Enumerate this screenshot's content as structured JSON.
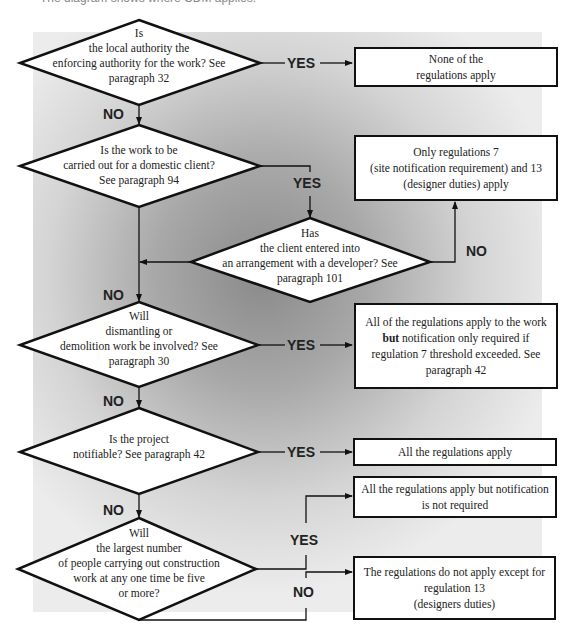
{
  "caption_partial": "The diagram shows where CDM applies.",
  "decisions": [
    {
      "lines": [
        "Is",
        "the local authority the",
        "enforcing authority for the work? See",
        "paragraph 32"
      ]
    },
    {
      "lines": [
        "Is the work to be",
        "carried out for a domestic client?",
        "See paragraph 94"
      ]
    },
    {
      "lines": [
        "Has",
        "the client entered into",
        "an arrangement with a developer? See",
        "paragraph 101"
      ]
    },
    {
      "lines": [
        "Will",
        "dismantling or",
        "demolition work be involved? See",
        "paragraph 30"
      ]
    },
    {
      "lines": [
        "Is the project",
        "notifiable? See paragraph 42"
      ]
    },
    {
      "lines": [
        "Will",
        "the largest number",
        "of people carrying out construction",
        "work at any one time be five",
        "or more?"
      ]
    }
  ],
  "outcomes": [
    {
      "lines": [
        "None of the",
        "regulations apply"
      ]
    },
    {
      "lines": [
        "Only regulations 7",
        "(site notification requirement) and 13",
        "(designer duties) apply"
      ]
    },
    {
      "lines_html": [
        "All of the regulations apply to the work",
        "notification only required if",
        "regulation 7 threshold exceeded. See",
        "paragraph 42"
      ],
      "bold_word": "but"
    },
    {
      "lines": [
        "All the regulations apply"
      ]
    },
    {
      "lines": [
        "All the regulations apply but notification",
        "is not required"
      ]
    },
    {
      "lines": [
        "The regulations do not apply except for",
        "regulation 13",
        "(designers duties)"
      ]
    }
  ],
  "labels": {
    "yes": "YES",
    "no": "NO"
  },
  "colors": {
    "stroke": "#111111",
    "box_fill": "#ffffff",
    "bg_dark": "#8a8a8a",
    "bg_light": "#ececec"
  }
}
